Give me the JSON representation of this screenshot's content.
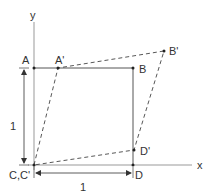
{
  "diagram": {
    "type": "shear-transformation",
    "axes": {
      "x_label": "x",
      "y_label": "y"
    },
    "points": {
      "A": {
        "label": "A"
      },
      "A_prime": {
        "label": "A'"
      },
      "B": {
        "label": "B"
      },
      "B_prime": {
        "label": "B'"
      },
      "C": {
        "label": "C,C'"
      },
      "D": {
        "label": "D"
      },
      "D_prime": {
        "label": "D'"
      }
    },
    "dimensions": {
      "vertical": "1",
      "horizontal": "1"
    },
    "colors": {
      "solid": "#555555",
      "dashed": "#444444",
      "axis": "#888888",
      "text": "#333333"
    }
  }
}
